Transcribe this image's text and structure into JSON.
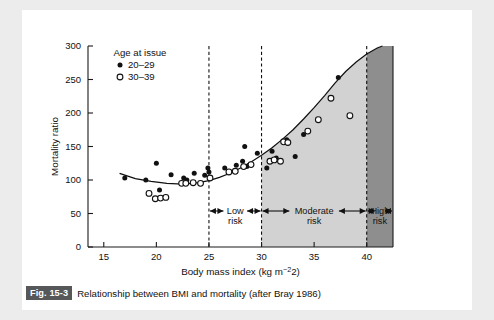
{
  "figure": {
    "badge": "Fig. 15-3",
    "caption": "Relationship between BMI and mortality (after Bray 1986)"
  },
  "legend": {
    "title": "Age at issue",
    "entries": [
      {
        "marker": "filled-circle",
        "label": "20–29"
      },
      {
        "marker": "open-circle",
        "label": "30–39"
      }
    ]
  },
  "zones": [
    {
      "name": "low-risk",
      "line1": "Low",
      "line2": "risk",
      "from": 25,
      "to": 30,
      "fill": "none"
    },
    {
      "name": "moderate-risk",
      "line1": "Moderate",
      "line2": "risk",
      "from": 30,
      "to": 40,
      "fill": "#d2d2d2"
    },
    {
      "name": "high-risk",
      "line1": "High",
      "line2": "risk",
      "from": 40,
      "to": 42.5,
      "fill": "#8e8e8e"
    }
  ],
  "chart_data": {
    "type": "scatter",
    "title": "",
    "xlabel": "Body mass index (kg m−2)",
    "ylabel": "Mortality ratio",
    "xlim": [
      13.5,
      42.5
    ],
    "ylim": [
      0,
      300
    ],
    "xticks": [
      15,
      20,
      25,
      30,
      35,
      40
    ],
    "yticks": [
      0,
      50,
      100,
      150,
      200,
      250,
      300
    ],
    "xticklabels": [
      "15",
      "20",
      "25",
      "30",
      "35",
      "40"
    ],
    "yticklabels": [
      "0",
      "50",
      "100",
      "150",
      "200",
      "250",
      "300"
    ],
    "grid": false,
    "legend_position": "top-left",
    "vertical_reference_lines": [
      25,
      30,
      40
    ],
    "series": [
      {
        "name": "20–29",
        "marker": "filled-circle",
        "points": [
          [
            17.0,
            103
          ],
          [
            19.0,
            100
          ],
          [
            20.0,
            125
          ],
          [
            20.3,
            85
          ],
          [
            21.4,
            108
          ],
          [
            22.6,
            103
          ],
          [
            22.9,
            100
          ],
          [
            23.6,
            110
          ],
          [
            24.6,
            107
          ],
          [
            24.9,
            118
          ],
          [
            25.0,
            112
          ],
          [
            26.5,
            118
          ],
          [
            27.6,
            122
          ],
          [
            28.2,
            128
          ],
          [
            28.4,
            150
          ],
          [
            28.6,
            120
          ],
          [
            29.6,
            140
          ],
          [
            30.5,
            118
          ],
          [
            31.0,
            143
          ],
          [
            31.4,
            133
          ],
          [
            32.4,
            160
          ],
          [
            33.2,
            135
          ],
          [
            34.0,
            168
          ],
          [
            37.3,
            253
          ]
        ]
      },
      {
        "name": "30–39",
        "marker": "open-circle",
        "points": [
          [
            19.3,
            80
          ],
          [
            19.9,
            72
          ],
          [
            20.4,
            73
          ],
          [
            20.9,
            74
          ],
          [
            22.4,
            95
          ],
          [
            22.8,
            95
          ],
          [
            23.5,
            96
          ],
          [
            24.2,
            95
          ],
          [
            25.1,
            103
          ],
          [
            26.9,
            112
          ],
          [
            27.5,
            113
          ],
          [
            28.3,
            120
          ],
          [
            29.0,
            123
          ],
          [
            30.8,
            128
          ],
          [
            31.2,
            130
          ],
          [
            31.8,
            128
          ],
          [
            32.1,
            157
          ],
          [
            32.5,
            156
          ],
          [
            34.4,
            173
          ],
          [
            35.4,
            190
          ],
          [
            36.6,
            222
          ],
          [
            38.4,
            196
          ]
        ]
      }
    ],
    "fitted_curve": {
      "name": "fitted-mortality-curve",
      "description": "J-shaped fitted curve, minimum near BMI 23",
      "points": [
        [
          16.5,
          110
        ],
        [
          18.0,
          102
        ],
        [
          19.5,
          98
        ],
        [
          21.0,
          95
        ],
        [
          22.5,
          94
        ],
        [
          24.0,
          96
        ],
        [
          25.0,
          99
        ],
        [
          26.0,
          104
        ],
        [
          27.0,
          110
        ],
        [
          28.0,
          118
        ],
        [
          29.0,
          127
        ],
        [
          30.0,
          137
        ],
        [
          31.0,
          148
        ],
        [
          32.0,
          161
        ],
        [
          33.0,
          175
        ],
        [
          34.0,
          191
        ],
        [
          35.0,
          208
        ],
        [
          36.0,
          226
        ],
        [
          37.0,
          245
        ],
        [
          38.0,
          262
        ],
        [
          39.0,
          276
        ],
        [
          40.0,
          288
        ],
        [
          41.0,
          297
        ],
        [
          41.5,
          300
        ]
      ]
    }
  }
}
